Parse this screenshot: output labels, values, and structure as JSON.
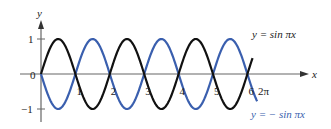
{
  "chart_data": {
    "type": "line",
    "title": "",
    "xlabel": "x",
    "ylabel": "y",
    "xlim": [
      0,
      6.6
    ],
    "ylim": [
      -1,
      1
    ],
    "x_ticks": [
      "0",
      "1",
      "2",
      "3",
      "4",
      "5",
      "6"
    ],
    "y_ticks": [
      "1",
      "-1"
    ],
    "grid": false,
    "series": [
      {
        "name": "y = sin πx",
        "color": "#111111",
        "x_range": [
          0,
          6.15
        ],
        "formula": "sin(pi*x)"
      },
      {
        "name": "y = − sin πx",
        "color": "#3a5fae",
        "x_range": [
          0,
          6.283
        ],
        "formula": "-sin(pi*x)"
      }
    ],
    "annotations": [
      "2π"
    ]
  },
  "labels": {
    "y_axis": "y",
    "x_axis": "x",
    "origin": "0",
    "y_pos": "1",
    "y_neg": "−1",
    "two_pi": "2π",
    "sin_label": "y  =  sin πx",
    "neg_sin_label": "y  =  − sin πx"
  },
  "colors": {
    "black": "#111111",
    "blue": "#3a5fae",
    "axis": "#555555"
  }
}
